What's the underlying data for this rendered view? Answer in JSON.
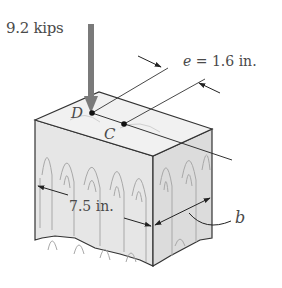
{
  "figure": {
    "type": "mechanics-of-materials-diagram"
  },
  "labels": {
    "load": "9.2 kips",
    "eccentricity_var": "e",
    "eccentricity_eq": " = 1.6 in.",
    "point_d": "D",
    "point_c": "C",
    "width": "7.5 in.",
    "depth_var": "b"
  },
  "colors": {
    "load_arrow": "#7a7a7a",
    "outline": "#333333",
    "wood_face": "#e6e6e6",
    "wood_top": "#f1f1f1",
    "grain": "#a8a8a8",
    "text": "#4a4a4a"
  }
}
